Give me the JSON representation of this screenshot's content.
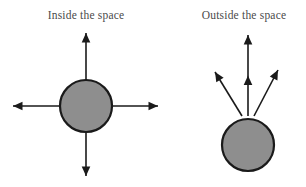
{
  "figure": {
    "background_color": "#ffffff",
    "width": 306,
    "height": 187
  },
  "captions": {
    "left": "Inside the space",
    "right": "Outside the space"
  },
  "style": {
    "circle_fill": "#8e8e8e",
    "circle_stroke": "#1a1a1a",
    "circle_stroke_width": 2.2,
    "arrow_color": "#1a1a1a",
    "arrow_line_width": 1.6,
    "caption_color": "#4a4a4a"
  },
  "panels": [
    {
      "id": "inside-the-space",
      "label": "Inside the space",
      "circle": {
        "cx": 86,
        "cy": 106,
        "r": 26
      },
      "notch": {
        "cx": 86,
        "cy": 80,
        "width": 11,
        "height": 7
      },
      "arrows": [
        {
          "name": "arrow-up",
          "direction": "up",
          "x1": 86,
          "y1": 80,
          "x2": 86,
          "y2": 33,
          "heads": 1
        },
        {
          "name": "arrow-down",
          "direction": "down",
          "x1": 86,
          "y1": 132,
          "x2": 86,
          "y2": 176,
          "heads": 1
        },
        {
          "name": "arrow-left",
          "direction": "left",
          "x1": 60,
          "y1": 106,
          "x2": 13,
          "y2": 106,
          "heads": 1
        },
        {
          "name": "arrow-right",
          "direction": "right",
          "x1": 112,
          "y1": 106,
          "x2": 158,
          "y2": 106,
          "heads": 1
        }
      ]
    },
    {
      "id": "outside-the-space",
      "label": "Outside the space",
      "circle": {
        "cx": 248,
        "cy": 145,
        "r": 26
      },
      "notch": {
        "cx": 248,
        "cy": 119,
        "width": 11,
        "height": 7
      },
      "arrows": [
        {
          "name": "arrow-up-left",
          "direction": "up-left",
          "x1": 242,
          "y1": 116,
          "x2": 215,
          "y2": 72,
          "heads": 1
        },
        {
          "name": "arrow-up",
          "direction": "up",
          "x1": 248,
          "y1": 116,
          "x2": 248,
          "y2": 35,
          "heads": 2
        },
        {
          "name": "arrow-up-right",
          "direction": "up-right",
          "x1": 254,
          "y1": 116,
          "x2": 278,
          "y2": 70,
          "heads": 1
        }
      ]
    }
  ]
}
